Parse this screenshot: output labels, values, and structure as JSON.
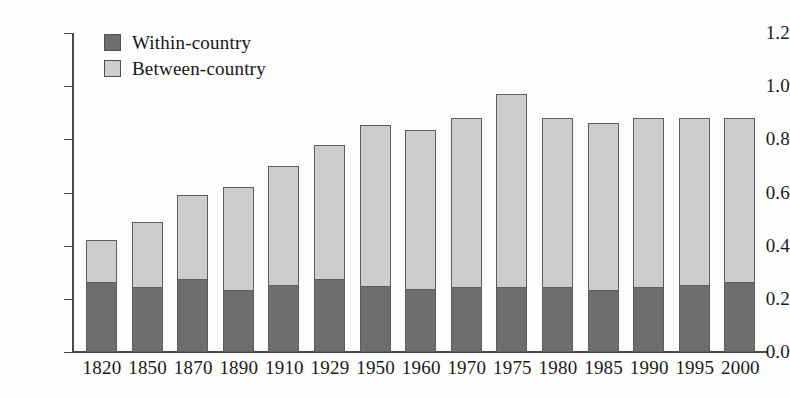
{
  "chart_data": {
    "type": "bar",
    "subtype": "stacked-bar",
    "title": "",
    "subtitle": "",
    "xlabel": "",
    "ylabel": "",
    "ylim": [
      0.0,
      1.2
    ],
    "yticks": [
      "0.0",
      "0.2",
      "0.4",
      "0.6",
      "0.8",
      "1.0",
      "1.2"
    ],
    "ytick_values": [
      0.0,
      0.2,
      0.4,
      0.6,
      0.8,
      1.0,
      1.2
    ],
    "grid": false,
    "legend_position": "top-left-inside",
    "categories": [
      "1820",
      "1850",
      "1870",
      "1890",
      "1910",
      "1929",
      "1950",
      "1960",
      "1970",
      "1975",
      "1980",
      "1985",
      "1990",
      "1995",
      "2000"
    ],
    "series": [
      {
        "name": "Within-country",
        "color": "#6e6e6e",
        "values": [
          0.26,
          0.24,
          0.27,
          0.23,
          0.25,
          0.27,
          0.245,
          0.235,
          0.24,
          0.24,
          0.24,
          0.23,
          0.24,
          0.25,
          0.26
        ]
      },
      {
        "name": "Between-country",
        "color": "#cdcdcd",
        "values": [
          0.16,
          0.25,
          0.32,
          0.39,
          0.45,
          0.51,
          0.61,
          0.6,
          0.64,
          0.73,
          0.64,
          0.63,
          0.64,
          0.63,
          0.62
        ]
      }
    ],
    "totals": [
      0.42,
      0.49,
      0.59,
      0.62,
      0.7,
      0.78,
      0.855,
      0.835,
      0.88,
      0.97,
      0.88,
      0.86,
      0.88,
      0.88,
      0.88
    ],
    "annotations": []
  },
  "legend": {
    "items": [
      {
        "label": "Within-country",
        "key": "within"
      },
      {
        "label": "Between-country",
        "key": "between"
      }
    ]
  },
  "colors": {
    "within": "#6e6e6e",
    "between": "#cdcdcd",
    "axis": "#4a4a4a",
    "text": "#1b1b1b",
    "background": "#fdfdfc"
  }
}
